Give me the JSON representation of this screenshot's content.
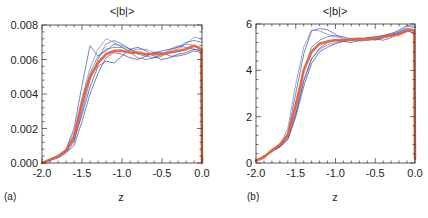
{
  "chart_data": [
    {
      "type": "line",
      "panel_label": "(a)",
      "title": "<|b|>",
      "xlabel": "z",
      "ylabel": "",
      "xlim": [
        -2.0,
        0.0
      ],
      "ylim": [
        0.0,
        0.008
      ],
      "xticks": [
        -2.0,
        -1.5,
        -1.0,
        -0.5,
        0.0
      ],
      "xtick_labels": [
        "-2.0",
        "-1.5",
        "-1.0",
        "-0.5",
        "0.0"
      ],
      "yticks": [
        0.0,
        0.002,
        0.004,
        0.006,
        0.008
      ],
      "ytick_labels": [
        "0.000",
        "0.002",
        "0.004",
        "0.006",
        "0.008"
      ],
      "grid": false,
      "series": [
        {
          "name": "mean",
          "color": "#e8623a",
          "x": [
            -2.0,
            -1.9,
            -1.8,
            -1.7,
            -1.6,
            -1.5,
            -1.45,
            -1.4,
            -1.3,
            -1.2,
            -1.1,
            -1.0,
            -0.9,
            -0.8,
            -0.7,
            -0.6,
            -0.5,
            -0.4,
            -0.3,
            -0.2,
            -0.1,
            -0.05,
            -0.01,
            0.0
          ],
          "y": [
            0.0,
            0.0002,
            0.0004,
            0.0007,
            0.0015,
            0.0034,
            0.0043,
            0.005,
            0.0058,
            0.0063,
            0.0065,
            0.0065,
            0.0064,
            0.0064,
            0.0063,
            0.0063,
            0.0063,
            0.0064,
            0.0065,
            0.0066,
            0.0068,
            0.0067,
            0.0066,
            0.0
          ]
        },
        {
          "name": "run-1",
          "color": "#3a4fa8",
          "x": [
            -2.0,
            -1.8,
            -1.7,
            -1.6,
            -1.5,
            -1.4,
            -1.3,
            -1.2,
            -1.1,
            -1.0,
            -0.9,
            -0.8,
            -0.7,
            -0.6,
            -0.5,
            -0.4,
            -0.3,
            -0.2,
            -0.1,
            0.0
          ],
          "y": [
            0.0,
            0.0004,
            0.0008,
            0.002,
            0.0045,
            0.0068,
            0.0062,
            0.0065,
            0.0069,
            0.0068,
            0.0066,
            0.0064,
            0.0063,
            0.0064,
            0.0065,
            0.0066,
            0.0067,
            0.007,
            0.0071,
            0.007
          ]
        },
        {
          "name": "run-2",
          "color": "#5466b5",
          "x": [
            -2.0,
            -1.8,
            -1.7,
            -1.6,
            -1.5,
            -1.4,
            -1.3,
            -1.2,
            -1.1,
            -1.0,
            -0.9,
            -0.8,
            -0.7,
            -0.6,
            -0.5,
            -0.4,
            -0.3,
            -0.2,
            -0.1,
            0.0
          ],
          "y": [
            0.0,
            0.0003,
            0.0006,
            0.0012,
            0.003,
            0.0048,
            0.006,
            0.0069,
            0.0071,
            0.0069,
            0.0066,
            0.0063,
            0.0062,
            0.0061,
            0.0062,
            0.0065,
            0.0067,
            0.0069,
            0.0068,
            0.0066
          ]
        },
        {
          "name": "run-3",
          "color": "#2c3f96",
          "x": [
            -2.0,
            -1.8,
            -1.7,
            -1.6,
            -1.5,
            -1.4,
            -1.3,
            -1.2,
            -1.1,
            -1.0,
            -0.9,
            -0.8,
            -0.7,
            -0.6,
            -0.5,
            -0.4,
            -0.3,
            -0.2,
            -0.1,
            0.0
          ],
          "y": [
            0.0,
            0.0004,
            0.0007,
            0.0013,
            0.0028,
            0.0044,
            0.0056,
            0.0059,
            0.0058,
            0.0062,
            0.0066,
            0.0067,
            0.0065,
            0.0062,
            0.006,
            0.0061,
            0.0063,
            0.0064,
            0.0066,
            0.0065
          ]
        },
        {
          "name": "run-4",
          "color": "#6f7cc2",
          "x": [
            -2.0,
            -1.8,
            -1.7,
            -1.6,
            -1.5,
            -1.4,
            -1.3,
            -1.2,
            -1.1,
            -1.0,
            -0.9,
            -0.8,
            -0.7,
            -0.6,
            -0.5,
            -0.4,
            -0.3,
            -0.2,
            -0.1,
            0.0
          ],
          "y": [
            0.0,
            0.0004,
            0.0008,
            0.0018,
            0.0038,
            0.0055,
            0.0066,
            0.0072,
            0.007,
            0.0067,
            0.0065,
            0.0066,
            0.0066,
            0.0064,
            0.0063,
            0.0064,
            0.0066,
            0.0069,
            0.0073,
            0.0072
          ]
        },
        {
          "name": "run-5",
          "color": "#3347a0",
          "x": [
            -2.0,
            -1.8,
            -1.7,
            -1.6,
            -1.5,
            -1.4,
            -1.3,
            -1.2,
            -1.1,
            -1.0,
            -0.9,
            -0.8,
            -0.7,
            -0.6,
            -0.5,
            -0.4,
            -0.3,
            -0.2,
            -0.1,
            0.0
          ],
          "y": [
            0.0,
            0.0003,
            0.0006,
            0.001,
            0.0024,
            0.004,
            0.0052,
            0.0061,
            0.0064,
            0.0063,
            0.0061,
            0.006,
            0.0062,
            0.0064,
            0.0064,
            0.0062,
            0.0062,
            0.0063,
            0.0065,
            0.0064
          ]
        },
        {
          "name": "run-6",
          "color": "#4a5cb0",
          "x": [
            -2.0,
            -1.8,
            -1.7,
            -1.6,
            -1.5,
            -1.4,
            -1.3,
            -1.2,
            -1.1,
            -1.0,
            -0.9,
            -0.8,
            -0.7,
            -0.6,
            -0.5,
            -0.4,
            -0.3,
            -0.2,
            -0.1,
            0.0
          ],
          "y": [
            0.0,
            0.0004,
            0.0007,
            0.0016,
            0.0036,
            0.0052,
            0.0062,
            0.0066,
            0.0067,
            0.0067,
            0.0064,
            0.0061,
            0.006,
            0.0061,
            0.0063,
            0.0066,
            0.0068,
            0.0067,
            0.0066,
            0.0065
          ]
        }
      ]
    },
    {
      "type": "line",
      "panel_label": "(b)",
      "title": "<|b|>",
      "xlabel": "z",
      "ylabel": "",
      "xlim": [
        -2.0,
        0.0
      ],
      "ylim": [
        0,
        6
      ],
      "xticks": [
        -2.0,
        -1.5,
        -1.0,
        -0.5,
        0.0
      ],
      "xtick_labels": [
        "-2.0",
        "-1.5",
        "-1.0",
        "-0.5",
        "0.0"
      ],
      "yticks": [
        0,
        2,
        4,
        6
      ],
      "ytick_labels": [
        "0",
        "2",
        "4",
        "6"
      ],
      "grid": false,
      "series": [
        {
          "name": "mean",
          "color": "#e8623a",
          "x": [
            -2.0,
            -1.9,
            -1.8,
            -1.7,
            -1.6,
            -1.5,
            -1.45,
            -1.4,
            -1.3,
            -1.2,
            -1.1,
            -1.0,
            -0.9,
            -0.8,
            -0.7,
            -0.6,
            -0.5,
            -0.4,
            -0.3,
            -0.2,
            -0.1,
            -0.05,
            -0.01,
            0.0
          ],
          "y": [
            0.1,
            0.25,
            0.55,
            0.8,
            1.2,
            2.5,
            3.2,
            4.0,
            4.8,
            5.15,
            5.25,
            5.3,
            5.3,
            5.35,
            5.35,
            5.35,
            5.4,
            5.45,
            5.5,
            5.55,
            5.7,
            5.75,
            5.7,
            0.2
          ]
        },
        {
          "name": "run-1",
          "color": "#3a4fa8",
          "x": [
            -2.0,
            -1.8,
            -1.7,
            -1.6,
            -1.5,
            -1.4,
            -1.3,
            -1.2,
            -1.1,
            -1.0,
            -0.9,
            -0.8,
            -0.7,
            -0.6,
            -0.5,
            -0.4,
            -0.3,
            -0.2,
            -0.1,
            0.0
          ],
          "y": [
            0.1,
            0.5,
            0.75,
            1.3,
            3.0,
            4.7,
            5.7,
            5.8,
            5.75,
            5.55,
            5.35,
            5.3,
            5.35,
            5.4,
            5.4,
            5.5,
            5.6,
            5.7,
            5.9,
            5.85
          ]
        },
        {
          "name": "run-2",
          "color": "#5466b5",
          "x": [
            -2.0,
            -1.8,
            -1.7,
            -1.6,
            -1.5,
            -1.4,
            -1.3,
            -1.2,
            -1.1,
            -1.0,
            -0.9,
            -0.8,
            -0.7,
            -0.6,
            -0.5,
            -0.4,
            -0.3,
            -0.2,
            -0.1,
            0.0
          ],
          "y": [
            0.1,
            0.5,
            0.7,
            1.1,
            2.2,
            3.6,
            4.5,
            4.9,
            5.1,
            5.2,
            5.3,
            5.35,
            5.4,
            5.35,
            5.3,
            5.4,
            5.55,
            5.65,
            5.8,
            5.75
          ]
        },
        {
          "name": "run-3",
          "color": "#2c3f96",
          "x": [
            -2.0,
            -1.8,
            -1.7,
            -1.6,
            -1.5,
            -1.4,
            -1.3,
            -1.2,
            -1.1,
            -1.0,
            -0.9,
            -0.8,
            -0.7,
            -0.6,
            -0.5,
            -0.4,
            -0.3,
            -0.2,
            -0.1,
            0.0
          ],
          "y": [
            0.1,
            0.5,
            0.7,
            1.0,
            2.0,
            3.3,
            4.3,
            4.8,
            5.0,
            5.15,
            5.25,
            5.3,
            5.35,
            5.4,
            5.45,
            5.5,
            5.55,
            5.6,
            5.7,
            5.6
          ]
        },
        {
          "name": "run-4",
          "color": "#6f7cc2",
          "x": [
            -2.0,
            -1.8,
            -1.7,
            -1.6,
            -1.5,
            -1.4,
            -1.3,
            -1.2,
            -1.1,
            -1.0,
            -0.9,
            -0.8,
            -0.7,
            -0.6,
            -0.5,
            -0.4,
            -0.3,
            -0.2,
            -0.1,
            0.0
          ],
          "y": [
            0.1,
            0.5,
            0.75,
            1.5,
            3.4,
            5.0,
            5.75,
            5.7,
            5.55,
            5.45,
            5.4,
            5.3,
            5.25,
            5.3,
            5.35,
            5.45,
            5.55,
            5.75,
            5.95,
            5.9
          ]
        },
        {
          "name": "run-5",
          "color": "#3347a0",
          "x": [
            -2.0,
            -1.8,
            -1.7,
            -1.6,
            -1.5,
            -1.4,
            -1.3,
            -1.2,
            -1.1,
            -1.0,
            -0.9,
            -0.8,
            -0.7,
            -0.6,
            -0.5,
            -0.4,
            -0.3,
            -0.2,
            -0.1,
            0.0
          ],
          "y": [
            0.1,
            0.5,
            0.7,
            1.05,
            2.1,
            3.5,
            4.5,
            4.95,
            5.2,
            5.3,
            5.25,
            5.2,
            5.3,
            5.4,
            5.35,
            5.3,
            5.4,
            5.6,
            5.75,
            5.55
          ]
        },
        {
          "name": "run-6",
          "color": "#4a5cb0",
          "x": [
            -2.0,
            -1.8,
            -1.7,
            -1.6,
            -1.5,
            -1.4,
            -1.3,
            -1.2,
            -1.1,
            -1.0,
            -0.9,
            -0.8,
            -0.7,
            -0.6,
            -0.5,
            -0.4,
            -0.3,
            -0.2,
            -0.1,
            0.0
          ],
          "y": [
            0.1,
            0.5,
            0.72,
            1.2,
            2.6,
            4.0,
            5.0,
            5.3,
            5.45,
            5.5,
            5.45,
            5.35,
            5.3,
            5.3,
            5.35,
            5.4,
            5.5,
            5.65,
            5.8,
            5.7
          ]
        }
      ]
    }
  ]
}
